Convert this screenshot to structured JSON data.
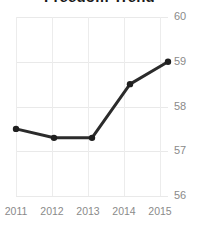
{
  "chart_data": {
    "type": "line",
    "title": "Freedom Trend",
    "xlabel": "",
    "ylabel": "",
    "categories": [
      "2011",
      "2012",
      "2013",
      "2014",
      "2015"
    ],
    "values": [
      57.5,
      57.3,
      57.3,
      58.5,
      59.0
    ],
    "series": [
      {
        "name": "Freedom Score",
        "values": [
          57.5,
          57.3,
          57.3,
          58.5,
          59.0
        ]
      }
    ],
    "ylim": [
      56,
      60
    ],
    "yticks": [
      60,
      59,
      58,
      57,
      56
    ],
    "xticks": [
      "2011",
      "2012",
      "2013",
      "2014",
      "2015"
    ],
    "grid": true,
    "y_axis_position": "right",
    "legend": "none",
    "line_color": "#2b2b2b",
    "marker": "circle",
    "marker_color": "#1f1f1f",
    "grid_color": "#e9e9e9",
    "tick_label_color": "#8a8a8a",
    "background_color": "#ffffff"
  },
  "yticks": [
    {
      "label": "60"
    },
    {
      "label": "59"
    },
    {
      "label": "58"
    },
    {
      "label": "57"
    },
    {
      "label": "56"
    }
  ],
  "xticks": [
    {
      "label": "2011"
    },
    {
      "label": "2012"
    },
    {
      "label": "2013"
    },
    {
      "label": "2014"
    },
    {
      "label": "2015"
    }
  ]
}
